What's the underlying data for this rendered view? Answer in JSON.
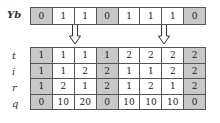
{
  "top_row": {
    "label": "Yb",
    "cells": [
      "0",
      "1",
      "1",
      "0",
      "1",
      "1",
      "1",
      "0"
    ],
    "shaded": [
      true,
      false,
      false,
      true,
      false,
      false,
      false,
      true
    ]
  },
  "arrows": [
    {
      "column_index": 2
    },
    {
      "column_index": 6
    }
  ],
  "bottom_table": {
    "shaded_columns": [
      0,
      3,
      7
    ],
    "rows": [
      {
        "label": "t",
        "cells": [
          "1",
          "1",
          "1",
          "1",
          "2",
          "2",
          "2",
          "2"
        ]
      },
      {
        "label": "i",
        "cells": [
          "1",
          "1",
          "2",
          "2",
          "1",
          "1",
          "2",
          "2"
        ]
      },
      {
        "label": "r",
        "cells": [
          "1",
          "2",
          "1",
          "2",
          "1",
          "2",
          "1",
          "2"
        ]
      },
      {
        "label": "q",
        "cells": [
          "0",
          "10",
          "20",
          "0",
          "10",
          "10",
          "10",
          "0"
        ]
      }
    ]
  },
  "colors": {
    "shade": "#c8c8c8",
    "border": "#555555"
  }
}
